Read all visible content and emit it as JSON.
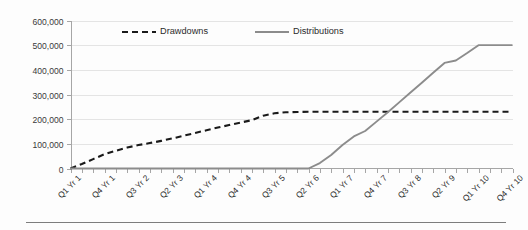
{
  "chart_data": {
    "type": "line",
    "title": "",
    "xlabel": "",
    "ylabel": "",
    "ylim": [
      0,
      600000
    ],
    "yticks": [
      0,
      100000,
      200000,
      300000,
      400000,
      500000,
      600000
    ],
    "ytick_labels": [
      "0",
      "100,000",
      "200,000",
      "300,000",
      "400,000",
      "500,000",
      "600,000"
    ],
    "grid": true,
    "legend_position": "top-center",
    "x": [
      "Q1 Yr 1",
      "Q2 Yr 1",
      "Q3 Yr 1",
      "Q4 Yr 1",
      "Q1 Yr 2",
      "Q2 Yr 2",
      "Q3 Yr 2",
      "Q4 Yr 2",
      "Q1 Yr 3",
      "Q2 Yr 3",
      "Q3 Yr 3",
      "Q4 Yr 3",
      "Q1 Yr 4",
      "Q2 Yr 4",
      "Q3 Yr 4",
      "Q4 Yr 4",
      "Q1 Yr 5",
      "Q2 Yr 5",
      "Q3 Yr 5",
      "Q4 Yr 5",
      "Q1 Yr 6",
      "Q2 Yr 6",
      "Q3 Yr 6",
      "Q4 Yr 6",
      "Q1 Yr 7",
      "Q2 Yr 7",
      "Q3 Yr 7",
      "Q4 Yr 7",
      "Q1 Yr 8",
      "Q2 Yr 8",
      "Q3 Yr 8",
      "Q4 Yr 8",
      "Q1 Yr 9",
      "Q2 Yr 9",
      "Q3 Yr 9",
      "Q4 Yr 9",
      "Q1 Yr 10",
      "Q2 Yr 10",
      "Q3 Yr 10",
      "Q4 Yr 10"
    ],
    "xtick_labels_shown": [
      "Q1 Yr 1",
      "Q4 Yr 1",
      "Q3 Yr 2",
      "Q2 Yr 3",
      "Q1 Yr 4",
      "Q4 Yr 4",
      "Q3 Yr 5",
      "Q2 Yr 6",
      "Q1 Yr 7",
      "Q4 Yr 7",
      "Q3 Yr 8",
      "Q2 Yr 9",
      "Q1 Yr 10",
      "Q4 Yr 10"
    ],
    "series": [
      {
        "name": "Drawdowns",
        "color": "#1a1a1a",
        "style": "dashed",
        "values": [
          0,
          18000,
          38000,
          58000,
          72000,
          85000,
          95000,
          103000,
          112000,
          122000,
          133000,
          144000,
          155000,
          166000,
          176000,
          186000,
          196000,
          214000,
          224000,
          228000,
          229000,
          230000,
          230000,
          230000,
          230000,
          230000,
          230000,
          230000,
          230000,
          230000,
          230000,
          230000,
          230000,
          230000,
          230000,
          230000,
          230000,
          230000,
          230000,
          230000
        ]
      },
      {
        "name": "Distributions",
        "color": "#8c8c8c",
        "style": "solid",
        "values": [
          0,
          0,
          0,
          0,
          0,
          0,
          0,
          0,
          0,
          0,
          0,
          0,
          0,
          0,
          0,
          0,
          0,
          0,
          0,
          0,
          0,
          0,
          22000,
          55000,
          95000,
          130000,
          152000,
          190000,
          228000,
          268000,
          308000,
          348000,
          388000,
          428000,
          438000,
          468000,
          500000,
          500000,
          500000,
          500000
        ]
      }
    ]
  },
  "legend": {
    "items": [
      {
        "label": "Drawdowns"
      },
      {
        "label": "Distributions"
      }
    ]
  }
}
